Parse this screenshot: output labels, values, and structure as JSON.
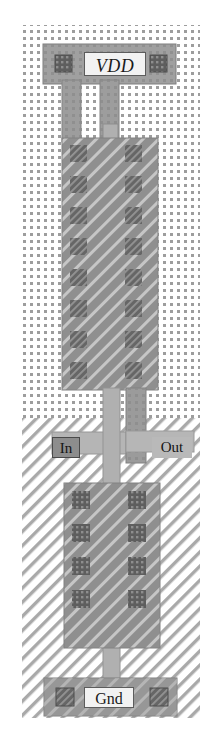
{
  "figure": {
    "kind": "ic-layout",
    "width": 224,
    "height": 744,
    "background_color": "#ffffff"
  },
  "labels": {
    "vdd": "VDD",
    "gnd": "Gnd",
    "input": "In",
    "output": "Out"
  },
  "layers": {
    "nwell": {
      "name": "n-well",
      "fill_pattern": "dots",
      "color": "#9a9a9a",
      "rect": {
        "x": 22,
        "y": 25,
        "width": 178,
        "height": 408
      }
    },
    "psubstrate": {
      "name": "p-substrate",
      "fill_pattern": "diagonal-hatch",
      "color": "#a8a8a8",
      "rect": {
        "x": 22,
        "y": 418,
        "width": 178,
        "height": 300
      }
    },
    "metal1": {
      "name": "metal1",
      "color": "#9e9e9e",
      "stroke": "#7a7a7a"
    },
    "poly": {
      "name": "polysilicon",
      "color": "#b4b4b4",
      "stroke": "#8c8c8c"
    },
    "active": {
      "name": "active-diffusion",
      "color": "#8f8f8f",
      "fill_pattern": "diagonal-hatch-light"
    },
    "contact": {
      "name": "contact-cut",
      "color": "#5f5f5f"
    }
  },
  "devices": [
    {
      "id": "pmos",
      "type": "PMOS",
      "region": "n-well",
      "active_rect": {
        "x": 62,
        "y": 138,
        "width": 96,
        "height": 252
      },
      "contact_columns": [
        78,
        133
      ],
      "contact_rows": [
        152,
        183,
        214,
        245,
        276,
        307,
        338,
        369
      ],
      "contact_count": 16
    },
    {
      "id": "nmos",
      "type": "NMOS",
      "region": "p-substrate",
      "active_rect": {
        "x": 64,
        "y": 483,
        "width": 96,
        "height": 165
      },
      "contact_columns": [
        80,
        136
      ],
      "contact_rows": [
        497,
        530,
        563,
        596
      ],
      "contact_count": 8
    }
  ],
  "rails": [
    {
      "id": "vdd-rail",
      "net": "VDD",
      "rect": {
        "x": 43,
        "y": 44,
        "width": 133,
        "height": 40
      },
      "contacts": [
        {
          "x": 55,
          "y": 55,
          "size": 16
        },
        {
          "x": 150,
          "y": 55,
          "size": 16
        }
      ]
    },
    {
      "id": "gnd-rail",
      "net": "Gnd",
      "rect": {
        "x": 44,
        "y": 678,
        "width": 133,
        "height": 38
      },
      "contacts": [
        {
          "x": 56,
          "y": 688,
          "size": 16
        },
        {
          "x": 150,
          "y": 688,
          "size": 16
        }
      ]
    }
  ],
  "nets": [
    {
      "id": "vdd-drop",
      "net": "VDD",
      "layer": "metal1"
    },
    {
      "id": "out-rail",
      "net": "Out",
      "layer": "metal1"
    },
    {
      "id": "in-poly",
      "net": "In",
      "layer": "poly"
    },
    {
      "id": "gnd-drop",
      "net": "Gnd",
      "layer": "metal1"
    }
  ],
  "colors": {
    "metal": "#9e9e9e",
    "poly": "#b2b2b2",
    "active": "#8d8d8d",
    "contact": "#616161",
    "nwell_dot": "#999999",
    "hatch": "#b0b0b0",
    "label_box": "#f2f2f2",
    "label_text": "#1a1a1a"
  }
}
